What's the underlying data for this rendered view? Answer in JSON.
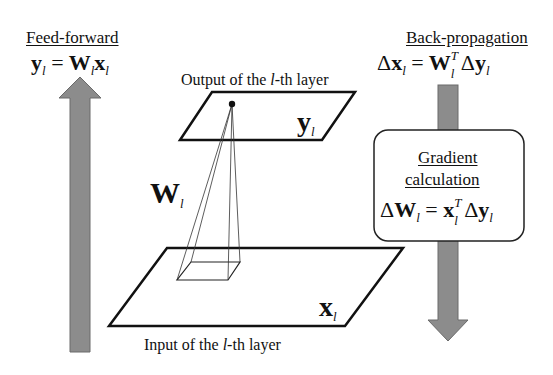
{
  "feed_forward": {
    "heading": "Feed-forward",
    "equation": {
      "lhs": "y",
      "lhs_sub": "l",
      "eq": "=",
      "w": "W",
      "w_sub": "l",
      "x": "x",
      "x_sub": "l"
    }
  },
  "back_propagation": {
    "heading": "Back-propagation",
    "equation": {
      "delta": "Δ",
      "lhs": "x",
      "lhs_sub": "l",
      "eq": "=",
      "w": "W",
      "w_sup": "T",
      "w_sub": "l",
      "delta2": "Δ",
      "y": "y",
      "y_sub": "l"
    }
  },
  "gradient_box": {
    "heading_line1": "Gradient",
    "heading_line2": "calculation",
    "equation": {
      "delta": "Δ",
      "lhs": "W",
      "lhs_sub": "l",
      "eq": "=",
      "x": "x",
      "x_sup": "T",
      "x_sub": "l",
      "delta2": "Δ",
      "y": "y",
      "y_sub": "l"
    }
  },
  "output_layer": {
    "caption_prefix": "Output of the ",
    "caption_var": "l",
    "caption_suffix": "-th layer",
    "symbol": "y",
    "symbol_sub": "l"
  },
  "input_layer": {
    "caption_prefix": "Input of the ",
    "caption_var": "l",
    "caption_suffix": "-th layer",
    "symbol": "x",
    "symbol_sub": "l"
  },
  "weights": {
    "symbol": "W",
    "symbol_sub": "l"
  },
  "colors": {
    "arrow_fill": "#8c8c8c",
    "arrow_stroke": "#555555",
    "line": "#111111"
  }
}
